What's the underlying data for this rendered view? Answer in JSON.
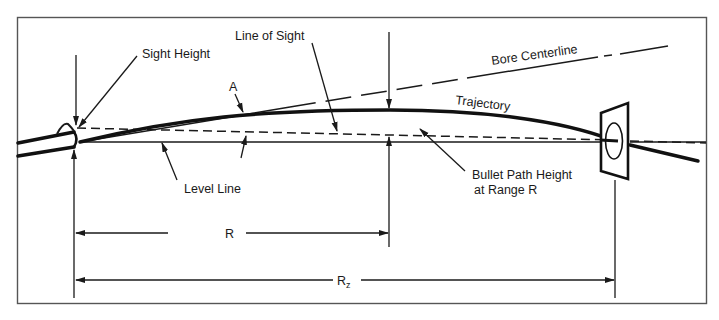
{
  "figure": {
    "labels": {
      "sight_height": "Sight Height",
      "line_of_sight": "Line of Sight",
      "bore_centerline": "Bore Centerline",
      "point_a": "A",
      "trajectory": "Trajectory",
      "level_line": "Level Line",
      "bullet_path_height_line1": "Bullet Path Height",
      "bullet_path_height_line2": "at Range R",
      "range_r": "R",
      "range_rz_base": "R",
      "range_rz_sub": "z"
    },
    "colors": {
      "ink": "#1a1a1a",
      "frame": "#555555",
      "background": "#ffffff"
    },
    "elements": [
      "rifle-barrel",
      "front-sight",
      "level-line",
      "line-of-sight",
      "bore-centerline",
      "trajectory-curve",
      "target",
      "dimension-R",
      "dimension-Rz"
    ]
  }
}
